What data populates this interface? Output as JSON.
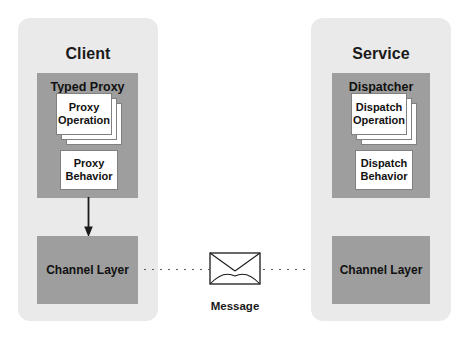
{
  "diagram": {
    "colors": {
      "background": "#ffffff",
      "panel": "#eaeaea",
      "component_box": "#9e9e9e",
      "card": "#ffffff",
      "card_border": "#808080",
      "text": "#111111",
      "connector": "#555555"
    }
  },
  "client": {
    "title": "Client",
    "typed_proxy": {
      "title": "Typed Proxy",
      "operation_card": {
        "line1": "Proxy",
        "line2": "Operation",
        "stack_count": 3
      },
      "behavior_box": {
        "line1": "Proxy",
        "line2": "Behavior"
      }
    },
    "channel_layer": {
      "label": "Channel Layer"
    }
  },
  "service": {
    "title": "Service",
    "dispatcher": {
      "title": "Dispatcher",
      "operation_card": {
        "line1": "Dispatch",
        "line2": "Operation",
        "stack_count": 3
      },
      "behavior_box": {
        "line1": "Dispatch",
        "line2": "Behavior"
      }
    },
    "channel_layer": {
      "label": "Channel Layer"
    }
  },
  "message": {
    "label": "Message",
    "icon": "envelope-icon"
  },
  "connectors": {
    "proxy_to_channel": "down-arrow-icon",
    "client_to_message": "dotted-line",
    "message_to_service": "dotted-line"
  }
}
